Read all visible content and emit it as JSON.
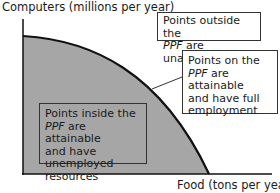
{
  "diagram": {
    "y_axis_label": "Computers (millions per year)",
    "x_axis_label": "Food (tons per year)",
    "curve_name": "PPF",
    "colors": {
      "fill": "#a6a6a6",
      "line": "#111111",
      "box_border": "#333333"
    },
    "annotations": {
      "outside": {
        "em": "PPF",
        "line1": "Points outside the",
        "line2_rest": " are unattainable"
      },
      "on": {
        "line1": "Points on the",
        "em": "PPF",
        "line2_rest": " are attainable",
        "line3": "and have full",
        "line4": "employment"
      },
      "inside": {
        "line1": "Points inside the",
        "em": "PPF",
        "line2_rest": " are attainable",
        "line3": "and have unemployed",
        "line4": "resources"
      }
    }
  }
}
